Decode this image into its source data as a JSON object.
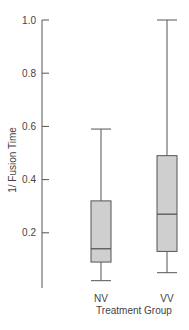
{
  "chart_data": {
    "type": "box",
    "title": "",
    "xlabel": "Treatment Group",
    "ylabel": "1/ Fusion Time",
    "categories": [
      "NV",
      "VV"
    ],
    "yticks": [
      "0.2",
      "0.4",
      "0.6",
      "0.8",
      "1.0"
    ],
    "ylim": [
      0.0,
      1.0
    ],
    "grid": false,
    "legend": null,
    "series": [
      {
        "name": "NV",
        "whisker_low": 0.02,
        "q1": 0.09,
        "median": 0.14,
        "q3": 0.32,
        "whisker_high": 0.59
      },
      {
        "name": "VV",
        "whisker_low": 0.05,
        "q1": 0.13,
        "median": 0.27,
        "q3": 0.49,
        "whisker_high": 1.0
      }
    ],
    "colors": {
      "box_fill": "#cfcfcf",
      "box_stroke": "#555555",
      "axis": "#555555"
    }
  }
}
